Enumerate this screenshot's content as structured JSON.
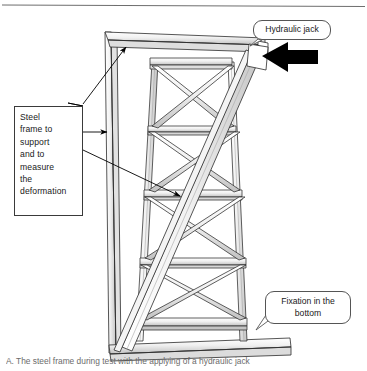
{
  "figure": {
    "top_rule": true,
    "caption": "A. The steel frame during test with the applying of a hydraulic jack"
  },
  "annotations": {
    "steel_frame_box": {
      "name": "steel-frame-note",
      "lines": [
        "Steel",
        "frame to",
        "support",
        "and to",
        "measure",
        "the",
        "deformation"
      ],
      "text": "Steel frame to support and to measure the deformation"
    },
    "hydraulic_jack": {
      "name": "hydraulic-jack-callout",
      "text": "Hydraulic jack"
    },
    "fixation": {
      "name": "fixation-callout",
      "line1": "Fixation in the",
      "line2": "bottom",
      "text": "Fixation in the bottom"
    }
  },
  "diagram": {
    "type": "engineering-line-drawing",
    "load_arrow": {
      "name": "load-arrow",
      "direction": "left",
      "color": "#000000",
      "meaning": "hydraulic jack applied horizontal load at top"
    },
    "colors": {
      "outline": "#2b2b2b",
      "shading": "#c9c9c9",
      "fill": "#ffffff",
      "callout_border": "#555555",
      "caption_text": "#6b6b6b"
    },
    "structure": {
      "outer_reaction_frame": "tall open portal frame at left, drawn in 3D double line",
      "tower_panels": 4,
      "bracing": "X / cross bracing in every panel",
      "inclined_member": "single long diagonal strut running from bottom-left to top-right",
      "base": "horizontal base plate at the bottom (fixation)"
    }
  }
}
